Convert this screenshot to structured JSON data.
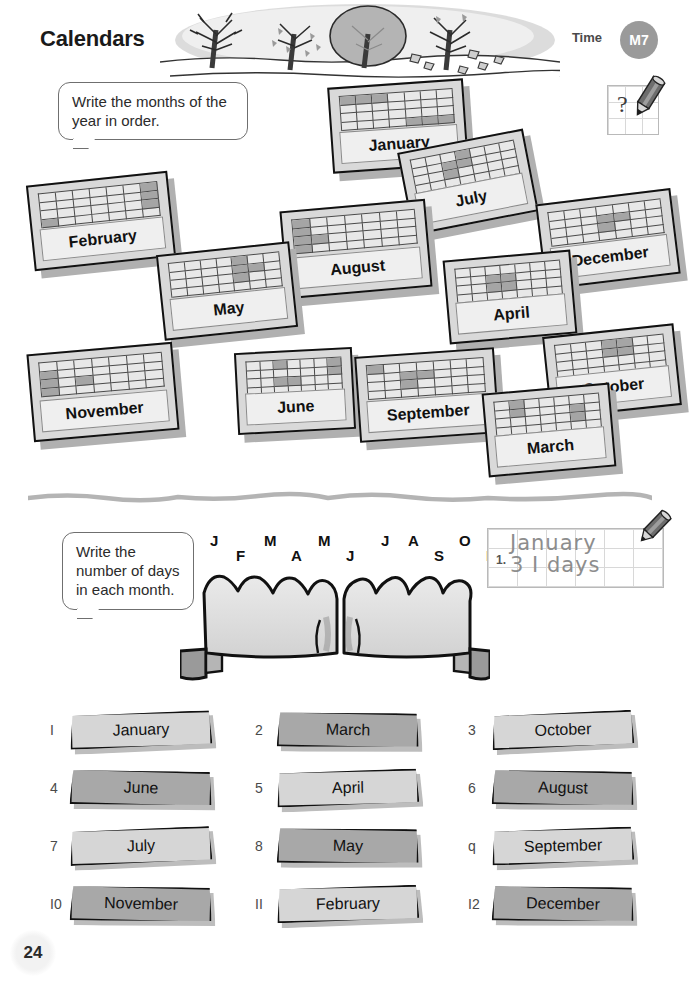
{
  "header": {
    "title": "Calendars",
    "topic_label": "Time",
    "badge": "M7",
    "question_mark": "?"
  },
  "page_number": "24",
  "exercise1": {
    "instruction": "Write the months of the year in order.",
    "cards": [
      {
        "month": "January",
        "shaded": [
          0,
          1,
          2,
          25,
          26,
          27
        ]
      },
      {
        "month": "July",
        "shaded": [
          3,
          9,
          10,
          16
        ]
      },
      {
        "month": "February",
        "shaded": [
          6,
          13,
          20,
          21
        ]
      },
      {
        "month": "December",
        "shaded": [
          10,
          11,
          17
        ]
      },
      {
        "month": "August",
        "shaded": [
          0,
          7,
          14,
          15,
          21
        ]
      },
      {
        "month": "May",
        "shaded": [
          4,
          11,
          12,
          18
        ]
      },
      {
        "month": "April",
        "shaded": [
          9,
          10,
          16,
          17
        ]
      },
      {
        "month": "October",
        "shaded": [
          3,
          4,
          10,
          11
        ]
      },
      {
        "month": "November",
        "shaded": [
          7,
          14,
          16,
          21
        ]
      },
      {
        "month": "June",
        "shaded": [
          2,
          6,
          13,
          16,
          17
        ]
      },
      {
        "month": "September",
        "shaded": [
          0,
          9,
          10,
          16
        ]
      },
      {
        "month": "March",
        "shaded": [
          1,
          8,
          12,
          19
        ]
      }
    ]
  },
  "exercise2": {
    "instruction": "Write the number of days in each month.",
    "knuckle_letters": [
      {
        "letter": "J",
        "position": "high"
      },
      {
        "letter": "F",
        "position": "low"
      },
      {
        "letter": "M",
        "position": "high"
      },
      {
        "letter": "A",
        "position": "low"
      },
      {
        "letter": "M",
        "position": "high"
      },
      {
        "letter": "J",
        "position": "low"
      },
      {
        "letter": "J",
        "position": "high"
      },
      {
        "letter": "A",
        "position": "high"
      },
      {
        "letter": "S",
        "position": "low"
      },
      {
        "letter": "O",
        "position": "high"
      },
      {
        "letter": "N",
        "position": "low"
      },
      {
        "letter": "D",
        "position": "high"
      }
    ],
    "example": {
      "number": "1.",
      "line1": "January",
      "line2": "3 I days"
    },
    "items": [
      {
        "num": "I",
        "month": "January",
        "tone": "light"
      },
      {
        "num": "2",
        "month": "March",
        "tone": "dark"
      },
      {
        "num": "3",
        "month": "October",
        "tone": "light"
      },
      {
        "num": "4",
        "month": "June",
        "tone": "dark"
      },
      {
        "num": "5",
        "month": "April",
        "tone": "light"
      },
      {
        "num": "6",
        "month": "August",
        "tone": "dark"
      },
      {
        "num": "7",
        "month": "July",
        "tone": "light"
      },
      {
        "num": "8",
        "month": "May",
        "tone": "dark"
      },
      {
        "num": "q",
        "month": "September",
        "tone": "light"
      },
      {
        "num": "I0",
        "month": "November",
        "tone": "dark"
      },
      {
        "num": "II",
        "month": "February",
        "tone": "light"
      },
      {
        "num": "I2",
        "month": "December",
        "tone": "dark"
      }
    ]
  },
  "colors": {
    "ink": "#111111",
    "card_face": "#d9d9d9",
    "card_shaded_cell": "#a5a5a5",
    "banner_light": "#d6d6d6",
    "banner_dark": "#a8a8a8",
    "badge_gray": "#9a9a9a"
  }
}
